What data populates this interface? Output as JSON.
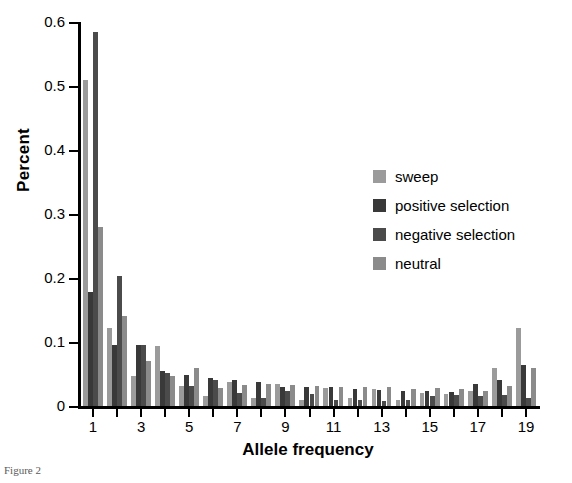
{
  "caption": "Figure 2",
  "chart_data": {
    "type": "bar",
    "title": "",
    "xlabel": "Allele frequency",
    "ylabel": "Percent",
    "ylim": [
      0,
      0.6
    ],
    "ytick_labels": [
      "0",
      "0.1",
      "0.2",
      "0.3",
      "0.4",
      "0.5",
      "0.6"
    ],
    "ytick_values": [
      0,
      0.1,
      0.2,
      0.3,
      0.4,
      0.5,
      0.6
    ],
    "grid": false,
    "legend_position": "right-middle",
    "categories": [
      1,
      2,
      3,
      4,
      5,
      6,
      7,
      8,
      9,
      10,
      11,
      12,
      13,
      14,
      15,
      16,
      17,
      18,
      19
    ],
    "xtick_labels": [
      "1",
      "",
      "3",
      "",
      "5",
      "",
      "7",
      "",
      "9",
      "",
      "11",
      "",
      "13",
      "",
      "15",
      "",
      "17",
      "",
      "19"
    ],
    "series": [
      {
        "name": "sweep",
        "color": "#9b9b9b",
        "values": [
          0.51,
          0.122,
          0.047,
          0.093,
          0.032,
          0.016,
          0.038,
          0.012,
          0.035,
          0.01,
          0.028,
          0.012,
          0.026,
          0.01,
          0.021,
          0.018,
          0.023,
          0.059,
          0.122
        ]
      },
      {
        "name": "positive selection",
        "color": "#393939",
        "values": [
          0.178,
          0.095,
          0.095,
          0.054,
          0.048,
          0.043,
          0.04,
          0.038,
          0.03,
          0.03,
          0.029,
          0.027,
          0.025,
          0.024,
          0.023,
          0.022,
          0.035,
          0.041,
          0.064
        ]
      },
      {
        "name": "negative selection",
        "color": "#4b4b4b",
        "values": [
          0.585,
          0.203,
          0.096,
          0.052,
          0.031,
          0.04,
          0.021,
          0.013,
          0.023,
          0.018,
          0.009,
          0.01,
          0.008,
          0.009,
          0.016,
          0.017,
          0.015,
          0.017,
          0.013
        ]
      },
      {
        "name": "neutral",
        "color": "#8b8b8b",
        "values": [
          0.28,
          0.14,
          0.07,
          0.047,
          0.06,
          0.028,
          0.033,
          0.034,
          0.033,
          0.031,
          0.03,
          0.03,
          0.029,
          0.027,
          0.028,
          0.027,
          0.023,
          0.031,
          0.059
        ]
      }
    ]
  },
  "legend": {
    "items": [
      {
        "label": "sweep",
        "color": "#9b9b9b"
      },
      {
        "label": "positive selection",
        "color": "#393939"
      },
      {
        "label": "negative selection",
        "color": "#4b4b4b"
      },
      {
        "label": "neutral",
        "color": "#8b8b8b"
      }
    ]
  }
}
